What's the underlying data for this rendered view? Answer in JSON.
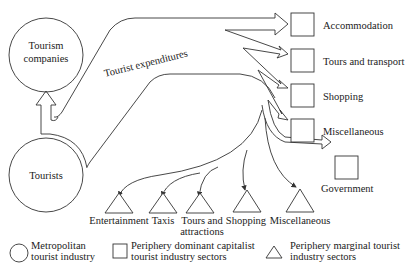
{
  "diagram": {
    "nodes": {
      "tourism_companies": {
        "line1": "Tourism",
        "line2": "companies",
        "shape": "circle",
        "category": "metropolitan"
      },
      "tourists": {
        "label": "Tourists",
        "shape": "circle",
        "category": "metropolitan"
      }
    },
    "flow_label": "Tourist expenditures",
    "dominant_sectors": [
      {
        "label": "Accommodation"
      },
      {
        "label": "Tours and transport"
      },
      {
        "label": "Shopping"
      },
      {
        "label": "Miscellaneous"
      }
    ],
    "government": {
      "label": "Government"
    },
    "marginal_sectors": [
      {
        "label": "Entertainment"
      },
      {
        "label": "Taxis"
      },
      {
        "line1": "Tours and",
        "line2": "attractions"
      },
      {
        "label": "Shopping"
      },
      {
        "label": "Miscellaneous"
      }
    ],
    "legend": [
      {
        "shape": "circle",
        "line1": "Metropolitan",
        "line2": "tourist industry"
      },
      {
        "shape": "square",
        "line1": "Periphery dominant capitalist",
        "line2": "tourist industry sectors"
      },
      {
        "shape": "triangle",
        "line1": "Periphery marginal tourist",
        "line2": "industry sectors"
      }
    ]
  }
}
